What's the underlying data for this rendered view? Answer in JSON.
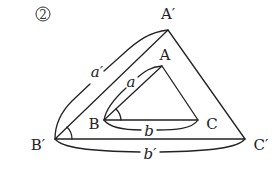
{
  "figure": {
    "number_label": "2",
    "stroke_color": "#222222",
    "background": "#ffffff"
  },
  "vertices": {
    "A_prime": {
      "label": "A′",
      "x": 168,
      "y": 30,
      "label_x": 168,
      "label_y": 14
    },
    "B_prime": {
      "label": "B′",
      "x": 55,
      "y": 139,
      "label_x": 38,
      "label_y": 145
    },
    "C_prime": {
      "label": "C′",
      "x": 245,
      "y": 139,
      "label_x": 261,
      "label_y": 145
    },
    "A": {
      "label": "A",
      "x": 162,
      "y": 66,
      "label_x": 165,
      "label_y": 55
    },
    "B": {
      "label": "B",
      "x": 104,
      "y": 120,
      "label_x": 94,
      "label_y": 124
    },
    "C": {
      "label": "C",
      "x": 198,
      "y": 120,
      "label_x": 212,
      "label_y": 124
    }
  },
  "sides": {
    "a_prime": {
      "label": "a′",
      "x": 97,
      "y": 72
    },
    "a": {
      "label": "a",
      "x": 131,
      "y": 82
    },
    "b": {
      "label": "b",
      "x": 149,
      "y": 132
    },
    "b_prime": {
      "label": "b′",
      "x": 150,
      "y": 155
    }
  },
  "angles": [
    {
      "vertex": "B",
      "description": "angle arc at B"
    },
    {
      "vertex": "B′",
      "description": "angle arc at B′"
    }
  ]
}
